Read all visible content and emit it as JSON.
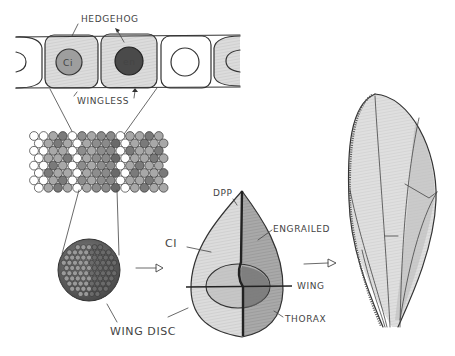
{
  "diagram": {
    "labels": {
      "hedgehog": "HEDGEHOG",
      "wingless": "WINGLESS",
      "nucleus_left": "Ci",
      "nucleus_right": "en",
      "ci": "CI",
      "dpp": "DPP",
      "engrailed": "ENGRAILED",
      "wing": "WING",
      "thorax": "THORAX",
      "wing_disc": "WING DISC"
    },
    "stages": [
      {
        "id": "cells",
        "description": "row of epithelial cells, two expressing hedgehog/wingless"
      },
      {
        "id": "tissue",
        "description": "magnified cell sheet patch with shaded domains"
      },
      {
        "id": "wing-disc",
        "description": "spherical cluster of cells"
      },
      {
        "id": "disc-map",
        "description": "teardrop wing disc fate map with compartments"
      },
      {
        "id": "adult-wing",
        "description": "adult wing with veins"
      }
    ],
    "colors": {
      "ink": "#333333",
      "shade_light": "#d8d8d8",
      "shade_mid": "#a8a8a8",
      "shade_dark": "#555555",
      "background": "#ffffff"
    }
  }
}
